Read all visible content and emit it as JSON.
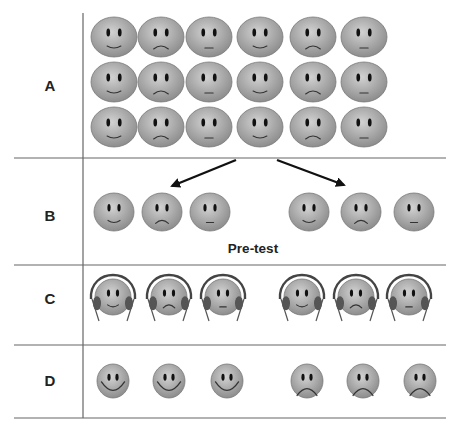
{
  "figure": {
    "rows": [
      {
        "label": "A",
        "description": "Full group of 18 participants (3 rows x 6)"
      },
      {
        "label": "B",
        "description": "Participants split into two groups",
        "caption": "Pre-test"
      },
      {
        "label": "C",
        "description": "Both groups wearing headphones"
      },
      {
        "label": "D",
        "description": "Left group happy, right group sad"
      }
    ],
    "colors": {
      "face_fill": "#a9a9a9",
      "face_highlight": "#d2d2d2",
      "face_edge": "#7a7a7a",
      "features": "#1a1a1a",
      "lines": "#555555",
      "arrow": "#111111"
    },
    "groupA": {
      "cols": [
        114,
        161,
        209,
        260,
        313,
        364
      ],
      "rows": [
        37,
        82,
        127
      ],
      "mouths": [
        "smile",
        "frown",
        "neutral",
        "smile",
        "frown",
        "neutral"
      ]
    },
    "groupB": {
      "faces": [
        {
          "x": 114,
          "mouth": "smile"
        },
        {
          "x": 162,
          "mouth": "frown"
        },
        {
          "x": 210,
          "mouth": "neutral"
        },
        {
          "x": 309,
          "mouth": "smile"
        },
        {
          "x": 361,
          "mouth": "frown"
        },
        {
          "x": 414,
          "mouth": "neutral"
        }
      ]
    },
    "groupC": {
      "faces": [
        {
          "x": 113,
          "mouth": "smile"
        },
        {
          "x": 169,
          "mouth": "frown"
        },
        {
          "x": 223,
          "mouth": "neutral"
        },
        {
          "x": 302,
          "mouth": "smile"
        },
        {
          "x": 356,
          "mouth": "frown"
        },
        {
          "x": 409,
          "mouth": "neutral"
        }
      ]
    },
    "groupD": {
      "faces": [
        {
          "x": 113,
          "mouth": "bigsmile"
        },
        {
          "x": 169,
          "mouth": "bigsmile"
        },
        {
          "x": 227,
          "mouth": "bigsmile"
        },
        {
          "x": 307,
          "mouth": "bigfrown"
        },
        {
          "x": 363,
          "mouth": "bigfrown"
        },
        {
          "x": 420,
          "mouth": "bigfrown"
        }
      ]
    }
  }
}
